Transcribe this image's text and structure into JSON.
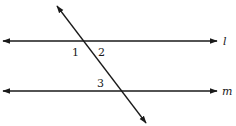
{
  "diagram": {
    "lines": [
      {
        "id": "l",
        "label": "l",
        "x1": 3,
        "y1": 41,
        "x2": 217,
        "y2": 41,
        "arrows": "both"
      },
      {
        "id": "m",
        "label": "m",
        "x1": 3,
        "y1": 91,
        "x2": 217,
        "y2": 91,
        "arrows": "both"
      },
      {
        "id": "transversal",
        "label": "",
        "x1": 57,
        "y1": 6,
        "x2": 146,
        "y2": 123,
        "arrows": "both"
      }
    ],
    "angle_labels": [
      {
        "id": "angle-1",
        "text": "1",
        "x": 72,
        "y": 56
      },
      {
        "id": "angle-2",
        "text": "2",
        "x": 98,
        "y": 56
      },
      {
        "id": "angle-3",
        "text": "3",
        "x": 97,
        "y": 87
      }
    ],
    "line_labels": {
      "l": {
        "text": "l",
        "x": 223,
        "y": 45
      },
      "m": {
        "text": "m",
        "x": 222,
        "y": 95
      }
    },
    "colors": {
      "stroke": "#1a1a1a",
      "background": "#ffffff"
    }
  }
}
